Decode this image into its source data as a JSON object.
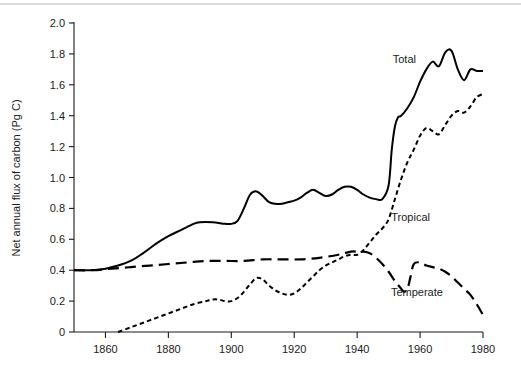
{
  "figure": {
    "background_color": "#ffffff",
    "ink_color": "#000000",
    "axis_title_y": "Net annual flux of carbon (Pg C)",
    "axis_title_x": ""
  },
  "chart_data": {
    "type": "line",
    "title": "",
    "subtitle": "",
    "xlabel": "",
    "ylabel": "Net annual flux of carbon (Pg C)",
    "xlim": [
      1850,
      1980
    ],
    "ylim": [
      0,
      2.0
    ],
    "grid": false,
    "legend": "inline-annotations",
    "x_ticks": [
      1860,
      1880,
      1900,
      1920,
      1940,
      1960,
      1980
    ],
    "x_tick_labels": [
      "1860",
      "1880",
      "1900",
      "1920",
      "1940",
      "1960",
      "1980"
    ],
    "y_ticks": [
      0,
      0.2,
      0.4,
      0.6,
      0.8,
      1.0,
      1.2,
      1.4,
      1.6,
      1.8,
      2.0
    ],
    "y_tick_labels": [
      "0",
      "0.2",
      "0.4",
      "0.6",
      "0.8",
      "1.0",
      "1.2",
      "1.4",
      "1.6",
      "1.8",
      "2.0"
    ],
    "annotations": [
      {
        "text": "Total",
        "x": 1955,
        "y": 1.74
      },
      {
        "text": "Tropical",
        "x": 1957,
        "y": 0.72
      },
      {
        "text": "Temperate",
        "x": 1959,
        "y": 0.23
      }
    ],
    "series": [
      {
        "name": "Total",
        "style": "solid",
        "x": [
          1850,
          1855,
          1860,
          1864,
          1868,
          1872,
          1876,
          1880,
          1884,
          1888,
          1890,
          1894,
          1898,
          1900,
          1902,
          1904,
          1906,
          1908,
          1910,
          1912,
          1914,
          1916,
          1918,
          1920,
          1922,
          1924,
          1926,
          1928,
          1930,
          1932,
          1934,
          1936,
          1938,
          1940,
          1942,
          1944,
          1946,
          1948,
          1950,
          1951,
          1952,
          1953,
          1954,
          1956,
          1958,
          1960,
          1962,
          1964,
          1966,
          1968,
          1970,
          1972,
          1974,
          1976,
          1978,
          1980
        ],
        "values": [
          0.4,
          0.4,
          0.41,
          0.43,
          0.46,
          0.51,
          0.57,
          0.62,
          0.66,
          0.7,
          0.71,
          0.71,
          0.7,
          0.7,
          0.72,
          0.8,
          0.89,
          0.91,
          0.88,
          0.84,
          0.83,
          0.83,
          0.84,
          0.85,
          0.87,
          0.9,
          0.92,
          0.9,
          0.88,
          0.89,
          0.92,
          0.94,
          0.94,
          0.92,
          0.89,
          0.87,
          0.86,
          0.86,
          0.95,
          1.18,
          1.33,
          1.39,
          1.4,
          1.45,
          1.52,
          1.62,
          1.7,
          1.75,
          1.72,
          1.81,
          1.82,
          1.7,
          1.63,
          1.7,
          1.69,
          1.69
        ]
      },
      {
        "name": "Tropical",
        "style": "dotted",
        "x": [
          1864,
          1868,
          1872,
          1876,
          1880,
          1884,
          1888,
          1892,
          1894,
          1896,
          1898,
          1900,
          1902,
          1904,
          1906,
          1908,
          1910,
          1912,
          1914,
          1916,
          1918,
          1920,
          1922,
          1924,
          1926,
          1928,
          1930,
          1932,
          1934,
          1936,
          1938,
          1940,
          1942,
          1944,
          1946,
          1948,
          1950,
          1952,
          1954,
          1956,
          1958,
          1960,
          1962,
          1964,
          1966,
          1968,
          1970,
          1972,
          1974,
          1976,
          1978,
          1980
        ],
        "values": [
          0.0,
          0.03,
          0.06,
          0.09,
          0.12,
          0.15,
          0.18,
          0.2,
          0.21,
          0.21,
          0.2,
          0.2,
          0.22,
          0.26,
          0.31,
          0.35,
          0.34,
          0.3,
          0.27,
          0.25,
          0.24,
          0.25,
          0.28,
          0.32,
          0.36,
          0.4,
          0.43,
          0.45,
          0.47,
          0.49,
          0.5,
          0.5,
          0.53,
          0.58,
          0.63,
          0.67,
          0.73,
          0.86,
          0.99,
          1.1,
          1.18,
          1.27,
          1.32,
          1.3,
          1.28,
          1.34,
          1.4,
          1.43,
          1.42,
          1.46,
          1.52,
          1.54
        ]
      },
      {
        "name": "Temperate",
        "style": "dashed",
        "x": [
          1850,
          1856,
          1862,
          1868,
          1874,
          1880,
          1886,
          1892,
          1898,
          1904,
          1910,
          1916,
          1922,
          1928,
          1934,
          1938,
          1940,
          1942,
          1944,
          1946,
          1948,
          1950,
          1952,
          1954,
          1955,
          1956,
          1957,
          1958,
          1960,
          1962,
          1964,
          1966,
          1968,
          1970,
          1972,
          1974,
          1976,
          1978,
          1980
        ],
        "values": [
          0.4,
          0.4,
          0.41,
          0.42,
          0.43,
          0.44,
          0.45,
          0.46,
          0.46,
          0.46,
          0.47,
          0.47,
          0.47,
          0.48,
          0.5,
          0.52,
          0.52,
          0.52,
          0.51,
          0.48,
          0.44,
          0.39,
          0.33,
          0.28,
          0.26,
          0.28,
          0.36,
          0.44,
          0.45,
          0.43,
          0.42,
          0.41,
          0.39,
          0.36,
          0.32,
          0.28,
          0.24,
          0.18,
          0.11
        ]
      }
    ]
  }
}
